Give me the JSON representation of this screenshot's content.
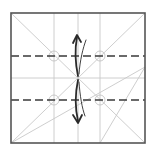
{
  "diagram": {
    "type": "origami-fold-diagram",
    "colors": {
      "background": "#ffffff",
      "border": "#555555",
      "crease": "#c8c8c8",
      "valley_fold": "#3a3a3a",
      "arrow": "#2a2a2a",
      "circle": "#bdbdbd"
    },
    "square": {
      "x1": 11,
      "y1": 13,
      "x2": 145,
      "y2": 143
    },
    "creases": [
      {
        "name": "diagonal-main",
        "x1": 11,
        "y1": 13,
        "x2": 145,
        "y2": 143
      },
      {
        "name": "diagonal-anti",
        "x1": 11,
        "y1": 143,
        "x2": 145,
        "y2": 13
      },
      {
        "name": "vertical-left",
        "x1": 54,
        "y1": 13,
        "x2": 54,
        "y2": 143
      },
      {
        "name": "vertical-center",
        "x1": 78,
        "y1": 13,
        "x2": 78,
        "y2": 143
      },
      {
        "name": "vertical-right",
        "x1": 100,
        "y1": 13,
        "x2": 100,
        "y2": 143
      },
      {
        "name": "horizontal-center",
        "x1": 11,
        "y1": 78,
        "x2": 145,
        "y2": 78
      },
      {
        "name": "shallow-diagonal",
        "x1": 11,
        "y1": 143,
        "x2": 145,
        "y2": 67
      },
      {
        "name": "steep-diagonal",
        "x1": 145,
        "y1": 67,
        "x2": 100,
        "y2": 143
      }
    ],
    "valley_folds": [
      {
        "name": "upper-valley-fold",
        "x1": 11,
        "y1": 56,
        "x2": 145,
        "y2": 56
      },
      {
        "name": "lower-valley-fold",
        "x1": 11,
        "y1": 100,
        "x2": 145,
        "y2": 100
      }
    ],
    "reference_circles": [
      {
        "name": "circle-upper-left",
        "cx": 54,
        "cy": 56,
        "r": 5
      },
      {
        "name": "circle-upper-right",
        "cx": 100,
        "cy": 56,
        "r": 5
      },
      {
        "name": "circle-lower-left",
        "cx": 54,
        "cy": 100,
        "r": 5
      },
      {
        "name": "circle-lower-right",
        "cx": 100,
        "cy": 100,
        "r": 5
      }
    ],
    "arrows": [
      {
        "name": "fold-up-arrow",
        "path": "M78,76 C75,62 75,48 77,37",
        "tail": "M79,74 C80,60 83,48 86,40",
        "head": "M73,43 L77,35 L81,42"
      },
      {
        "name": "fold-down-arrow",
        "path": "M78,80 C75,94 75,108 78,121",
        "tail": "M79,82 C80,96 82,108 85,116",
        "head": "M73,115 L78,123 L82,115"
      }
    ]
  }
}
